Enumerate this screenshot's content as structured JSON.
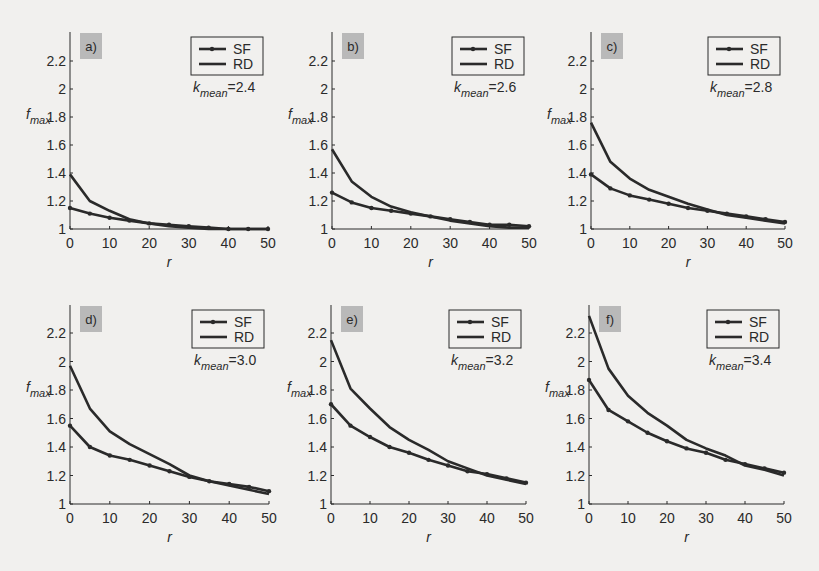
{
  "figure": {
    "background": "#f1f0ee",
    "line_color": "#2a2a2a",
    "tag_bg": "#b9b9b9"
  },
  "chart_data": [
    {
      "type": "line",
      "panel": "a)",
      "title": "",
      "xlabel": "r",
      "ylabel": "f_max",
      "annotation": "k_mean=2.4",
      "k_mean": 2.4,
      "xlim": [
        0,
        50
      ],
      "ylim": [
        1,
        2.4
      ],
      "xticks": [
        0,
        10,
        20,
        30,
        40,
        50
      ],
      "yticks": [
        1,
        1.2,
        1.4,
        1.6,
        1.8,
        2,
        2.2
      ],
      "legend": [
        "SF",
        "RD"
      ],
      "legend_position": "upper right",
      "grid": false,
      "x": [
        0,
        5,
        10,
        15,
        20,
        25,
        30,
        35,
        40,
        45,
        50
      ],
      "series": [
        {
          "name": "SF",
          "marker": "dot",
          "values": [
            1.15,
            1.11,
            1.08,
            1.06,
            1.04,
            1.03,
            1.02,
            1.01,
            1.0,
            1.0,
            1.0
          ]
        },
        {
          "name": "RD",
          "marker": "none",
          "values": [
            1.39,
            1.2,
            1.13,
            1.07,
            1.04,
            1.02,
            1.01,
            1.0,
            1.0,
            1.0,
            1.0
          ]
        }
      ]
    },
    {
      "type": "line",
      "panel": "b)",
      "title": "",
      "xlabel": "r",
      "ylabel": "f_max",
      "annotation": "k_mean=2.6",
      "k_mean": 2.6,
      "xlim": [
        0,
        50
      ],
      "ylim": [
        1,
        2.4
      ],
      "xticks": [
        0,
        10,
        20,
        30,
        40,
        50
      ],
      "yticks": [
        1,
        1.2,
        1.4,
        1.6,
        1.8,
        2,
        2.2
      ],
      "legend": [
        "SF",
        "RD"
      ],
      "legend_position": "upper right",
      "grid": false,
      "x": [
        0,
        5,
        10,
        15,
        20,
        25,
        30,
        35,
        40,
        45,
        50
      ],
      "series": [
        {
          "name": "SF",
          "marker": "dot",
          "values": [
            1.26,
            1.19,
            1.15,
            1.13,
            1.11,
            1.09,
            1.07,
            1.05,
            1.03,
            1.03,
            1.02
          ]
        },
        {
          "name": "RD",
          "marker": "none",
          "values": [
            1.57,
            1.34,
            1.23,
            1.16,
            1.12,
            1.09,
            1.06,
            1.04,
            1.02,
            1.01,
            1.01
          ]
        }
      ]
    },
    {
      "type": "line",
      "panel": "c)",
      "title": "",
      "xlabel": "r",
      "ylabel": "f_max",
      "annotation": "k_mean=2.8",
      "k_mean": 2.8,
      "xlim": [
        0,
        50
      ],
      "ylim": [
        1,
        2.4
      ],
      "xticks": [
        0,
        10,
        20,
        30,
        40,
        50
      ],
      "yticks": [
        1,
        1.2,
        1.4,
        1.6,
        1.8,
        2,
        2.2
      ],
      "legend": [
        "SF",
        "RD"
      ],
      "legend_position": "upper right",
      "grid": false,
      "x": [
        0,
        5,
        10,
        15,
        20,
        25,
        30,
        35,
        40,
        45,
        50
      ],
      "series": [
        {
          "name": "SF",
          "marker": "dot",
          "values": [
            1.39,
            1.29,
            1.24,
            1.21,
            1.18,
            1.15,
            1.13,
            1.11,
            1.09,
            1.07,
            1.05
          ]
        },
        {
          "name": "RD",
          "marker": "none",
          "values": [
            1.76,
            1.48,
            1.36,
            1.28,
            1.23,
            1.18,
            1.14,
            1.1,
            1.08,
            1.06,
            1.04
          ]
        }
      ]
    },
    {
      "type": "line",
      "panel": "d)",
      "title": "",
      "xlabel": "r",
      "ylabel": "f_max",
      "annotation": "k_mean=3.0",
      "k_mean": 3.0,
      "xlim": [
        0,
        50
      ],
      "ylim": [
        1,
        2.4
      ],
      "xticks": [
        0,
        10,
        20,
        30,
        40,
        50
      ],
      "yticks": [
        1,
        1.2,
        1.4,
        1.6,
        1.8,
        2,
        2.2
      ],
      "legend": [
        "SF",
        "RD"
      ],
      "legend_position": "upper right",
      "grid": false,
      "x": [
        0,
        5,
        10,
        15,
        20,
        25,
        30,
        35,
        40,
        45,
        50
      ],
      "series": [
        {
          "name": "SF",
          "marker": "dot",
          "values": [
            1.55,
            1.4,
            1.34,
            1.31,
            1.27,
            1.23,
            1.19,
            1.16,
            1.14,
            1.12,
            1.09
          ]
        },
        {
          "name": "RD",
          "marker": "none",
          "values": [
            1.97,
            1.67,
            1.51,
            1.42,
            1.35,
            1.28,
            1.2,
            1.16,
            1.13,
            1.1,
            1.07
          ]
        }
      ]
    },
    {
      "type": "line",
      "panel": "e)",
      "title": "",
      "xlabel": "r",
      "ylabel": "f_max",
      "annotation": "k_mean=3.2",
      "k_mean": 3.2,
      "xlim": [
        0,
        50
      ],
      "ylim": [
        1,
        2.4
      ],
      "xticks": [
        0,
        10,
        20,
        30,
        40,
        50
      ],
      "yticks": [
        1,
        1.2,
        1.4,
        1.6,
        1.8,
        2,
        2.2
      ],
      "legend": [
        "SF",
        "RD"
      ],
      "legend_position": "upper right",
      "grid": false,
      "x": [
        0,
        5,
        10,
        15,
        20,
        25,
        30,
        35,
        40,
        45,
        50
      ],
      "series": [
        {
          "name": "SF",
          "marker": "dot",
          "values": [
            1.7,
            1.55,
            1.47,
            1.4,
            1.36,
            1.31,
            1.27,
            1.23,
            1.21,
            1.18,
            1.15
          ]
        },
        {
          "name": "RD",
          "marker": "none",
          "values": [
            2.15,
            1.81,
            1.67,
            1.54,
            1.45,
            1.38,
            1.3,
            1.25,
            1.2,
            1.17,
            1.14
          ]
        }
      ]
    },
    {
      "type": "line",
      "panel": "f)",
      "title": "",
      "xlabel": "r",
      "ylabel": "f_max",
      "annotation": "k_mean=3.4",
      "k_mean": 3.4,
      "xlim": [
        0,
        50
      ],
      "ylim": [
        1,
        2.4
      ],
      "xticks": [
        0,
        10,
        20,
        30,
        40,
        50
      ],
      "yticks": [
        1,
        1.2,
        1.4,
        1.6,
        1.8,
        2,
        2.2
      ],
      "legend": [
        "SF",
        "RD"
      ],
      "legend_position": "upper right",
      "grid": false,
      "x": [
        0,
        5,
        10,
        15,
        20,
        25,
        30,
        35,
        40,
        45,
        50
      ],
      "series": [
        {
          "name": "SF",
          "marker": "dot",
          "values": [
            1.87,
            1.66,
            1.58,
            1.5,
            1.44,
            1.39,
            1.36,
            1.31,
            1.28,
            1.25,
            1.22
          ]
        },
        {
          "name": "RD",
          "marker": "none",
          "values": [
            2.32,
            1.95,
            1.76,
            1.64,
            1.55,
            1.45,
            1.39,
            1.34,
            1.27,
            1.24,
            1.2
          ]
        }
      ]
    }
  ]
}
